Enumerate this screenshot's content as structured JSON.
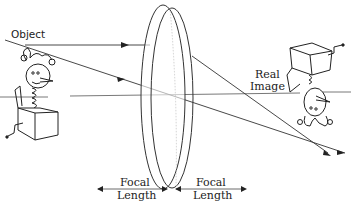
{
  "diagram": {
    "labels": {
      "object": "Object",
      "real_image_line1": "Real",
      "real_image_line2": "Image",
      "focal_left_line1": "Focal",
      "focal_left_line2": "Length",
      "focal_right_line1": "Focal",
      "focal_right_line2": "Length"
    },
    "elements": {
      "object_figure": "jack-in-the-box (upright)",
      "image_figure": "jack-in-the-box (inverted)",
      "lens": "convex lens",
      "rays": [
        "parallel ray refracted through focal point",
        "central ray through lens center",
        "optical axis"
      ]
    },
    "colors": {
      "line": "#333333",
      "text": "#222222",
      "background": "#ffffff"
    }
  }
}
